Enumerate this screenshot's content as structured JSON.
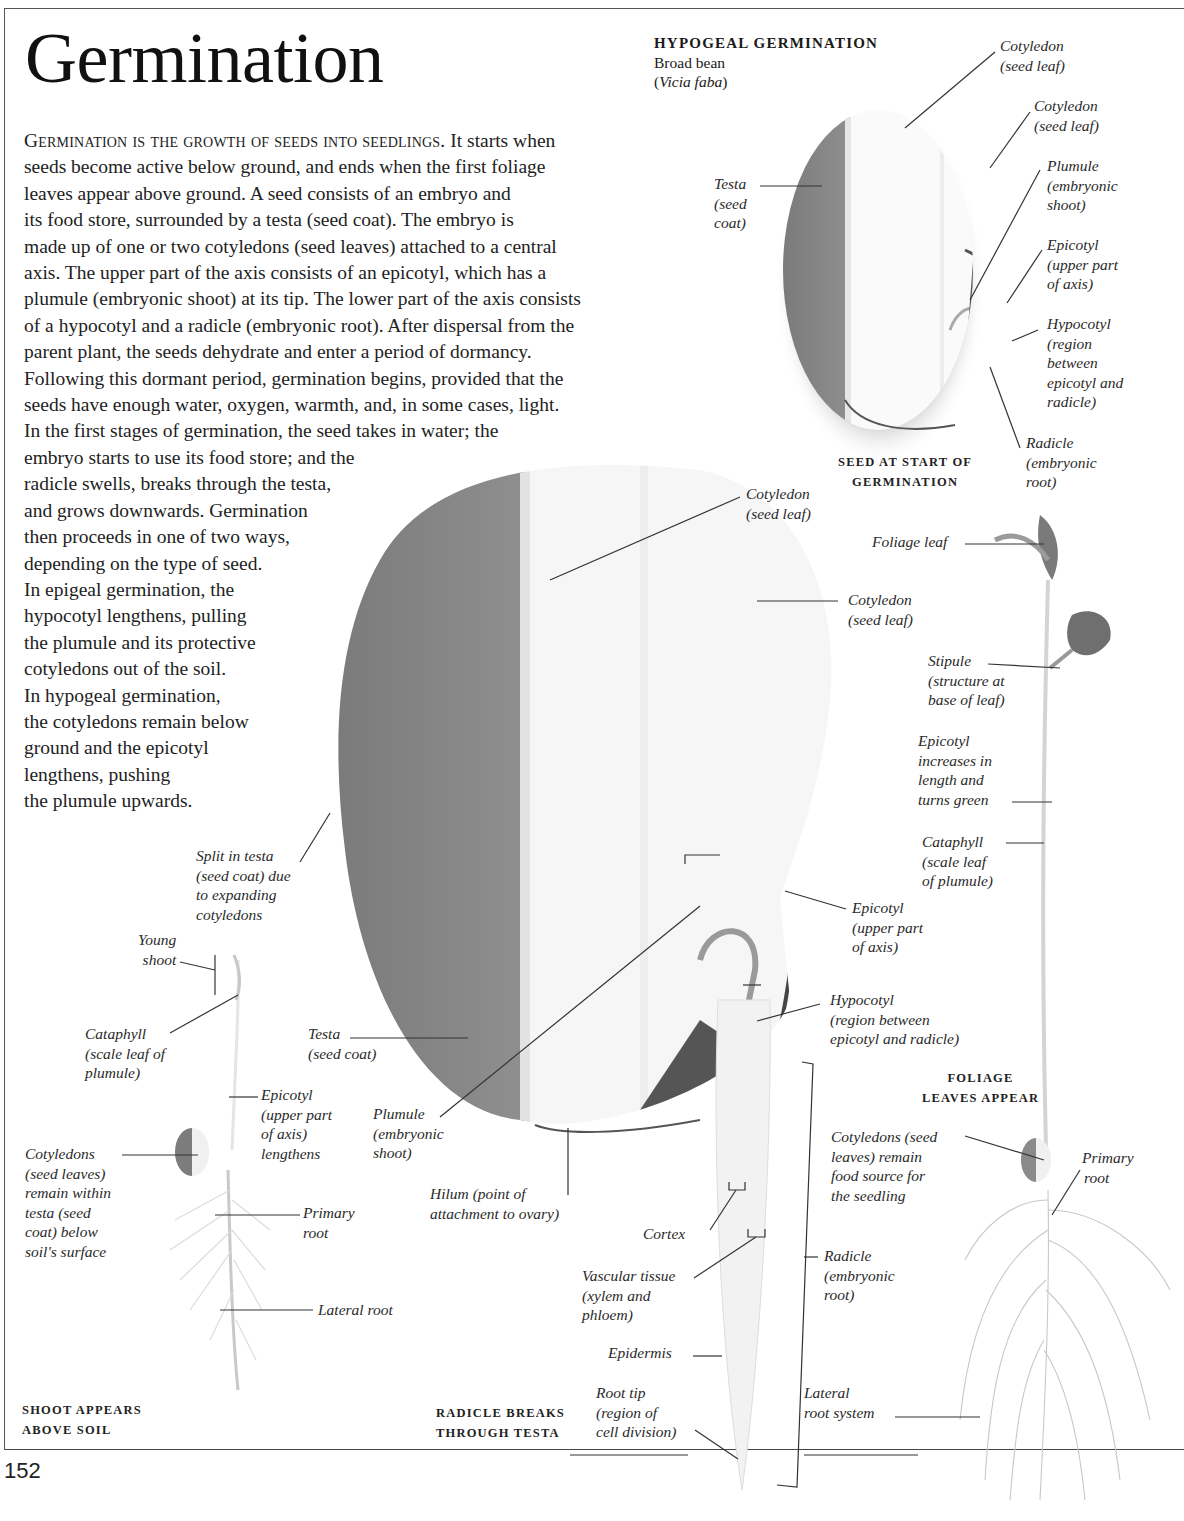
{
  "page": {
    "title": "Germination",
    "page_number": "152"
  },
  "intro": {
    "lead": "Germination is the growth of seeds into seedlings.",
    "lines": [
      " It starts when",
      "seeds become active below ground, and ends when the first foliage",
      "leaves appear above ground. A seed consists of an embryo and",
      "its food store, surrounded by a testa (seed coat). The embryo is",
      "made up of one or two cotyledons (seed leaves) attached to a central",
      "axis. The upper part of the axis consists of an epicotyl, which has a",
      "plumule (embryonic shoot) at its tip. The lower part of the axis consists",
      "of a hypocotyl and a radicle (embryonic root). After dispersal from the",
      "parent plant, the seeds dehydrate and enter a period of dormancy.",
      "Following this dormant period, germination begins, provided that the",
      "seeds have enough water, oxygen, warmth, and, in some cases, light.",
      "In the first stages of germination, the seed takes in water; the",
      "embryo starts to use its food store; and the",
      "radicle swells, breaks through the testa,",
      "and grows downwards. Germination",
      "then proceeds in one of two ways,",
      "depending on the type of seed.",
      "In epigeal germination, the",
      "hypocotyl lengthens, pulling",
      "the plumule and its protective",
      "cotyledons out of the soil.",
      "In hypogeal germination,",
      "the cotyledons remain below",
      "ground and the epicotyl",
      "lengthens, pushing",
      "the plumule upwards."
    ]
  },
  "hypogeal": {
    "heading": "HYPOGEAL GERMINATION",
    "common_name": "Broad bean",
    "species_open": "(",
    "species": "Vicia faba",
    "species_close": ")"
  },
  "seed_start": {
    "caption": [
      "SEED AT START OF",
      "GERMINATION"
    ],
    "labels": {
      "cotyledon1": [
        "Cotyledon",
        "(seed leaf)"
      ],
      "cotyledon2": [
        "Cotyledon",
        "(seed leaf)"
      ],
      "plumule": [
        "Plumule",
        "(embryonic",
        "shoot)"
      ],
      "epicotyl": [
        "Epicotyl",
        "(upper part",
        "of axis)"
      ],
      "hypocotyl": [
        "Hypocotyl",
        "(region",
        "between",
        "epicotyl and",
        "radicle)"
      ],
      "radicle": [
        "Radicle",
        "(embryonic",
        "root)"
      ],
      "testa": [
        "Testa",
        "(seed",
        "coat)"
      ]
    }
  },
  "radicle_breaks": {
    "caption": [
      "RADICLE BREAKS",
      "THROUGH TESTA"
    ],
    "labels": {
      "cotyledon1": [
        "Cotyledon",
        "(seed leaf)"
      ],
      "cotyledon2": [
        "Cotyledon",
        "(seed leaf)"
      ],
      "split": [
        "Split in testa",
        "(seed coat) due",
        "to expanding",
        "cotyledons"
      ],
      "epicotyl": [
        "Epicotyl",
        "(upper part",
        "of axis)"
      ],
      "hypocotyl": [
        "Hypocotyl",
        "(region between",
        "epicotyl and radicle)"
      ],
      "testa": [
        "Testa",
        "(seed coat)"
      ],
      "plumule": [
        "Plumule",
        "(embryonic",
        "shoot)"
      ],
      "hilum": [
        "Hilum (point of",
        "attachment to ovary)"
      ],
      "cortex": [
        "Cortex"
      ],
      "vascular": [
        "Vascular tissue",
        "(xylem and",
        "phloem)"
      ],
      "epidermis": [
        "Epidermis"
      ],
      "root_tip": [
        "Root tip",
        "(region of",
        "cell division)"
      ],
      "radicle": [
        "Radicle",
        "(embryonic",
        "root)"
      ]
    }
  },
  "shoot_appears": {
    "caption": [
      "SHOOT APPEARS",
      "ABOVE SOIL"
    ],
    "labels": {
      "young_shoot": [
        "Young",
        "shoot"
      ],
      "cataphyll": [
        "Cataphyll",
        "(scale leaf of",
        "plumule)"
      ],
      "epicotyl": [
        "Epicotyl",
        "(upper part",
        "of axis)",
        "lengthens"
      ],
      "cotyledons": [
        "Cotyledons",
        "(seed leaves)",
        "remain within",
        "testa (seed",
        "coat) below",
        "soil's surface"
      ],
      "primary_root": [
        "Primary",
        "root"
      ],
      "lateral_root": [
        "Lateral root"
      ]
    }
  },
  "foliage_leaves": {
    "caption": [
      "FOLIAGE",
      "LEAVES APPEAR"
    ],
    "labels": {
      "foliage_leaf": [
        "Foliage leaf"
      ],
      "stipule": [
        "Stipule",
        "(structure at",
        "base of leaf)"
      ],
      "epicotyl": [
        "Epicotyl",
        "increases in",
        "length and",
        "turns green"
      ],
      "cataphyll": [
        "Cataphyll",
        "(scale leaf",
        "of plumule)"
      ],
      "cotyledons": [
        "Cotyledons (seed",
        "leaves) remain",
        "food source for",
        "the seedling"
      ],
      "primary_root": [
        "Primary",
        "root"
      ],
      "lateral_root_system": [
        "Lateral",
        "root system"
      ]
    }
  }
}
